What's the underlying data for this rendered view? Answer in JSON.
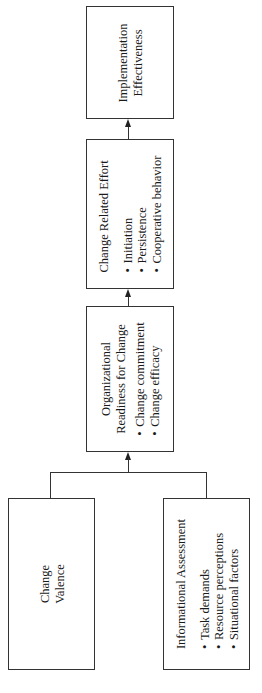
{
  "diagram": {
    "orientation": "rotated -90deg (text reads bottom to top)",
    "nodes": {
      "implementation": {
        "lines": [
          "Implementation",
          "Effectiveness"
        ],
        "bullets": []
      },
      "effort": {
        "title": "Change Related Effort",
        "bullets": [
          "Initiation",
          "Persistence",
          "Cooperative behavior"
        ]
      },
      "readiness": {
        "lines": [
          "Organizational",
          "Readiness for Change"
        ],
        "bullets": [
          "Change commitment",
          "Change efficacy"
        ]
      },
      "valence": {
        "lines": [
          "Change",
          "Valence"
        ],
        "bullets": []
      },
      "informational": {
        "title": "Informational Assessment",
        "bullets": [
          "Task demands",
          "Resource perceptions",
          "Situational factors"
        ]
      }
    },
    "edges": [
      {
        "from": "valence",
        "to": "readiness"
      },
      {
        "from": "informational",
        "to": "readiness"
      },
      {
        "from": "readiness",
        "to": "effort"
      },
      {
        "from": "effort",
        "to": "implementation"
      }
    ],
    "colors": {
      "line": "#333333",
      "background": "#ffffff",
      "text": "#1a1a1a"
    }
  }
}
